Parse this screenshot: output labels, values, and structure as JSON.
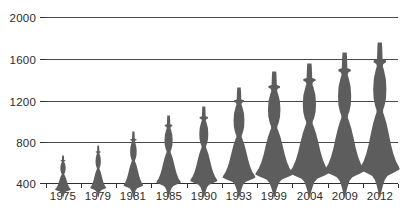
{
  "chart_data": {
    "type": "bar",
    "title": "",
    "subtitle": "",
    "xlabel": "",
    "ylabel": "",
    "categories": [
      "1975",
      "1979",
      "1981",
      "1985",
      "1990",
      "1993",
      "1999",
      "2004",
      "2009",
      "2012"
    ],
    "values": [
      670,
      766,
      901,
      1056,
      1142,
      1325,
      1480,
      1557,
      1663,
      1760
    ],
    "ylim": [
      400,
      2000
    ],
    "yticks": [
      400,
      800,
      1200,
      1600,
      2000
    ],
    "ytick_labels": [
      "400",
      "800",
      "1200",
      "1600",
      "2000"
    ],
    "xtick_labels": [
      "1975",
      "1979",
      "1981",
      "1985",
      "1990",
      "1993",
      "1999",
      "2004",
      "2009",
      "2012"
    ],
    "grid": true,
    "legend": false,
    "legend_position": "none",
    "marker_style": "human-figure-silhouette",
    "series": [
      {
        "name": "value",
        "values": [
          670,
          766,
          901,
          1056,
          1142,
          1325,
          1480,
          1557,
          1663,
          1760
        ]
      }
    ],
    "colors": {
      "figure_fill": "#5d5d5d",
      "gridline": "#4a4a4a",
      "axis": "#2f2f2f",
      "text": "#2b2b2b",
      "background": "#ffffff"
    }
  },
  "axis": {
    "y_ticks": [
      {
        "value": 2000,
        "label": "2000"
      },
      {
        "value": 1600,
        "label": "1600"
      },
      {
        "value": 1200,
        "label": "1200"
      },
      {
        "value": 800,
        "label": "800"
      },
      {
        "value": 400,
        "label": "400"
      }
    ],
    "x_ticks": [
      {
        "label": "1975"
      },
      {
        "label": "1979"
      },
      {
        "label": "1981"
      },
      {
        "label": "1985"
      },
      {
        "label": "1990"
      },
      {
        "label": "1993"
      },
      {
        "label": "1999"
      },
      {
        "label": "2004"
      },
      {
        "label": "2009"
      },
      {
        "label": "2012"
      }
    ]
  }
}
